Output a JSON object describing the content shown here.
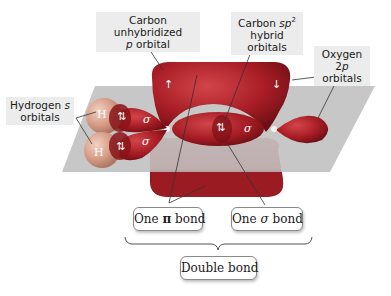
{
  "labels": {
    "carbon_p": {
      "line1": "Carbon unhybridized",
      "line2_italic": "p",
      "line2_rest": " orbital"
    },
    "carbon_sp2": {
      "line1_pre": "Carbon ",
      "line1_italic": "sp",
      "line1_sup": "2",
      "line2": "hybrid orbitals"
    },
    "oxygen_2p": {
      "line1_pre": "Oxygen 2",
      "line1_italic": "p",
      "line2": "orbitals"
    },
    "hydrogen_s": {
      "line1_pre": "Hydrogen ",
      "line1_italic": "s",
      "line2": "orbitals"
    }
  },
  "bonds": {
    "pi": {
      "pre": "One ",
      "symbol": "π",
      "post": " bond"
    },
    "sigma": {
      "pre": "One ",
      "symbol": "σ",
      "post": " bond"
    },
    "double": "Double bond"
  },
  "orbital_marks": {
    "h_atom": "H",
    "electron_pair": "⇅",
    "electron_up": "↑",
    "electron_down": "↓",
    "sigma": "σ"
  },
  "colors": {
    "orbital_red": "#b0222a",
    "orbital_dark": "#8a1419",
    "plane": "#b7b7b7",
    "h_sphere": "#d8a08a",
    "label_bg": "#ececec"
  }
}
